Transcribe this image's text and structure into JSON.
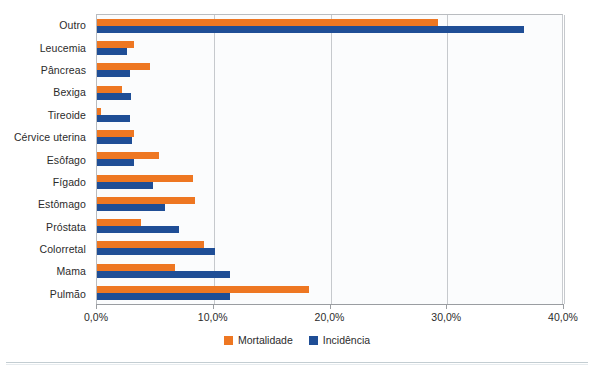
{
  "chart_data": {
    "type": "bar",
    "orientation": "horizontal",
    "title": "",
    "xlabel": "",
    "ylabel": "",
    "xlim": [
      0,
      40
    ],
    "xticks": [
      "0,0%",
      "10,0%",
      "20,0%",
      "30,0%",
      "40,0%"
    ],
    "xtick_values": [
      0,
      10,
      20,
      30,
      40
    ],
    "grid": true,
    "legend_position": "bottom-center",
    "categories": [
      "Outro",
      "Leucemia",
      "Pâncreas",
      "Bexiga",
      "Tireoide",
      "Cérvice uterina",
      "Esôfago",
      "Fígado",
      "Estômago",
      "Próstata",
      "Colorretal",
      "Mama",
      "Pulmão"
    ],
    "series": [
      {
        "name": "Mortalidade",
        "color": "#ee7722",
        "values": [
          29.2,
          3.2,
          4.5,
          2.1,
          0.3,
          3.2,
          5.3,
          8.2,
          8.4,
          3.8,
          9.2,
          6.7,
          18.2
        ]
      },
      {
        "name": "Incidência",
        "color": "#1f4e96",
        "values": [
          36.6,
          2.6,
          2.8,
          2.9,
          2.8,
          3.0,
          3.2,
          4.8,
          5.8,
          7.0,
          10.1,
          11.4,
          11.4
        ]
      }
    ]
  },
  "legend": {
    "items": [
      {
        "label": "Mortalidade",
        "color": "#ee7722"
      },
      {
        "label": "Incidência",
        "color": "#1f4e96"
      }
    ]
  }
}
